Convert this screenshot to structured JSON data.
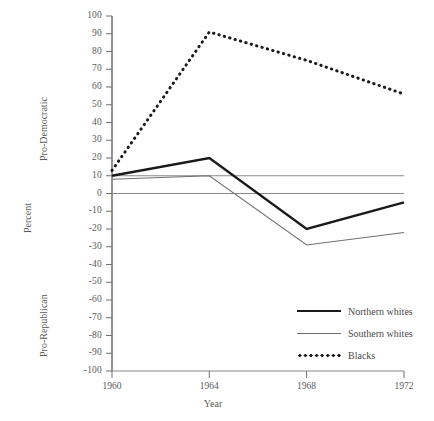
{
  "chart_data": {
    "type": "line",
    "title": "",
    "xlabel": "Year",
    "ylabel": "Percent",
    "ylabel_top": "Pro-Democratic",
    "ylabel_bottom": "Pro-Republican",
    "x": [
      1960,
      1964,
      1968,
      1972
    ],
    "xtick_labels": [
      "1960",
      "1964",
      "1968",
      "1972"
    ],
    "ylim": [
      -100,
      100
    ],
    "ytick_values": [
      100,
      90,
      80,
      70,
      60,
      50,
      40,
      30,
      20,
      10,
      0,
      -10,
      -20,
      -30,
      -40,
      -50,
      -60,
      -70,
      -80,
      -90,
      -100
    ],
    "ytick_labels": [
      "100",
      "90",
      "80",
      "70",
      "60",
      "50",
      "40",
      "30",
      "20",
      "10",
      "0",
      "-10",
      "-20",
      "-30",
      "-40",
      "-50",
      "-60",
      "-70",
      "-80",
      "-90",
      "-100"
    ],
    "grid": false,
    "legend_position": "lower-right",
    "reference_lines": [
      0,
      10
    ],
    "series": [
      {
        "name": "Northern whites",
        "style": "solid-thick",
        "color": "#1a1a1a",
        "values": [
          10,
          20,
          -20,
          -5
        ]
      },
      {
        "name": "Southern whites",
        "style": "solid-thin",
        "color": "#6f6f6f",
        "values": [
          8,
          10,
          -29,
          -22
        ]
      },
      {
        "name": "Blacks",
        "style": "dotted",
        "color": "#1a1a1a",
        "values": [
          13,
          91,
          75,
          56
        ]
      }
    ]
  },
  "axis": {
    "y_labels": [
      "100",
      "90",
      "80",
      "70",
      "60",
      "50",
      "40",
      "30",
      "20",
      "10",
      "0",
      "-10",
      "-20",
      "-30",
      "-40",
      "-50",
      "-60",
      "-70",
      "-80",
      "-90",
      "-100"
    ],
    "x_labels": [
      "1960",
      "1964",
      "1968",
      "1972"
    ],
    "x_title": "Year",
    "y_title": "Percent",
    "y_title_top": "Pro-Democratic",
    "y_title_bottom": "Pro-Republican"
  },
  "legend": {
    "items": [
      {
        "label": "Northern whites",
        "style": "solid-thick"
      },
      {
        "label": "Southern whites",
        "style": "solid-thin"
      },
      {
        "label": "Blacks",
        "style": "dotted"
      }
    ]
  }
}
